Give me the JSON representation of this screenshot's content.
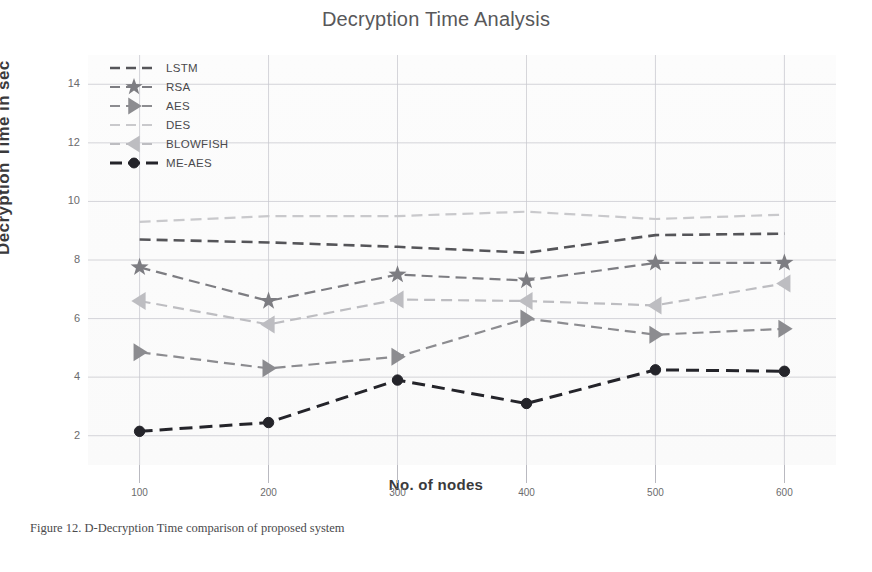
{
  "chart_data": {
    "type": "line",
    "title": "Decryption Time Analysis",
    "xlabel": "No. of nodes",
    "ylabel": "Decryption  Time in sec",
    "categories": [
      100,
      200,
      300,
      400,
      500,
      600
    ],
    "x_ticks": [
      "100",
      "200",
      "300",
      "400",
      "500",
      "600"
    ],
    "y_ticks": [
      "2",
      "4",
      "6",
      "8",
      "10",
      "12",
      "14"
    ],
    "ylim": [
      1.0,
      15.0
    ],
    "xlim": [
      60,
      640
    ],
    "grid": true,
    "legend_position": "top-left",
    "series": [
      {
        "name": "LSTM",
        "color": "#555559",
        "marker": "none",
        "dash": "dashed",
        "width": 2.6,
        "values": [
          8.7,
          8.6,
          8.45,
          8.25,
          8.85,
          8.9
        ]
      },
      {
        "name": "RSA",
        "color": "#7d7d82",
        "marker": "star",
        "dash": "dashed",
        "width": 2.2,
        "values": [
          7.75,
          6.6,
          7.5,
          7.3,
          7.9,
          7.9
        ]
      },
      {
        "name": "AES",
        "color": "#8c8c90",
        "marker": "triangle-right",
        "dash": "dashed",
        "width": 2.2,
        "values": [
          4.85,
          4.3,
          4.7,
          6.0,
          5.45,
          5.65
        ]
      },
      {
        "name": "DES",
        "color": "#c9c9cc",
        "marker": "none",
        "dash": "dashed",
        "width": 2.2,
        "values": [
          9.3,
          9.5,
          9.5,
          9.65,
          9.4,
          9.55
        ]
      },
      {
        "name": "BLOWFISH",
        "color": "#bdbdc1",
        "marker": "triangle-left",
        "dash": "dashed",
        "width": 2.2,
        "values": [
          6.6,
          5.8,
          6.65,
          6.6,
          6.45,
          7.2
        ]
      },
      {
        "name": "ME-AES",
        "color": "#24242a",
        "marker": "circle",
        "dash": "dashed",
        "width": 3.0,
        "values": [
          2.15,
          2.45,
          3.9,
          3.1,
          4.25,
          4.2
        ]
      }
    ]
  },
  "caption": {
    "text": "Figure 12. D-Decryption Time comparison of proposed system"
  },
  "colors": {
    "grid": "#c8c8cf",
    "title": "#58585a",
    "axis_label": "#3a3a3c",
    "tick": "#6b6b6d",
    "background": "#ffffff"
  }
}
